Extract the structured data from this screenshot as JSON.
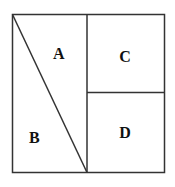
{
  "diagram": {
    "type": "partitioned-square",
    "stroke_color": "#333333",
    "background": "#ffffff",
    "regions": [
      {
        "id": "A",
        "label": "A",
        "description": "upper-right triangle of left half"
      },
      {
        "id": "B",
        "label": "B",
        "description": "lower-left triangle of left half"
      },
      {
        "id": "C",
        "label": "C",
        "description": "top-right square"
      },
      {
        "id": "D",
        "label": "D",
        "description": "bottom-right square"
      }
    ]
  }
}
